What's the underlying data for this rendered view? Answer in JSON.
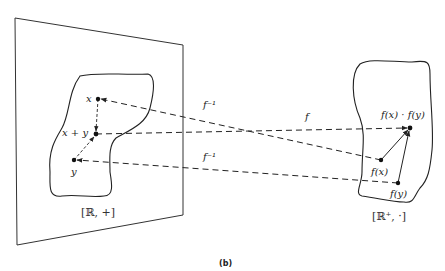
{
  "figure": {
    "caption": "(b)",
    "left_space": {
      "label": "[ℝ, +]",
      "points": {
        "x": "x",
        "x_plus_y": "x + y",
        "y": "y"
      }
    },
    "right_space": {
      "label": "[ℝ⁺, ·]",
      "points": {
        "fx_fy": "f(x) · f(y)",
        "fx": "f(x)",
        "fy": "f(y)"
      }
    },
    "mappings": {
      "f_inverse_top": "f⁻¹",
      "f": "f",
      "f_inverse_bottom": "f⁻¹"
    },
    "colors": {
      "stroke": "#222222",
      "background": "#ffffff"
    }
  }
}
